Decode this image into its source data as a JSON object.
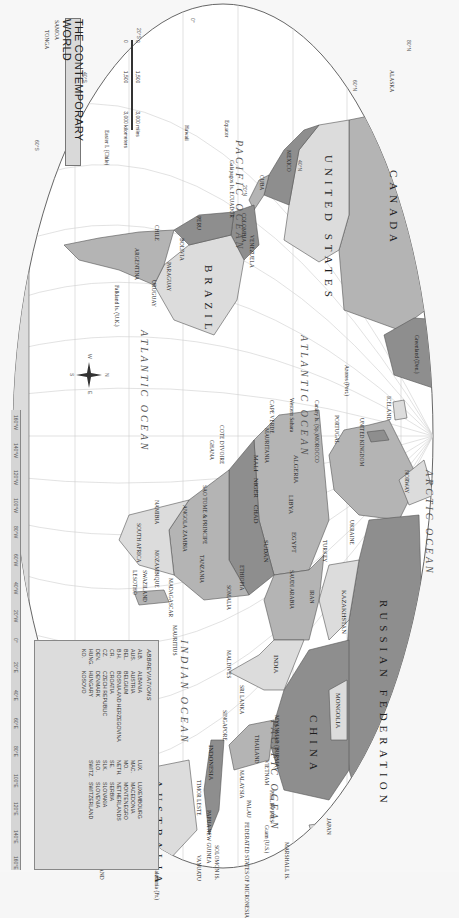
{
  "map": {
    "title": "THE CONTEMPORARY WORLD",
    "orientation": "rotated 90 degrees clockwise",
    "colors": {
      "background": "#f7f7f7",
      "ocean": "#ffffff",
      "land_light": "#dcdcdc",
      "land_mid": "#b4b4b4",
      "land_dark": "#8e8e8e",
      "graticule": "#c8c8c8",
      "border": "#555555"
    },
    "oceans": [
      {
        "id": "pacific-east",
        "label": "PACIFIC OCEAN"
      },
      {
        "id": "pacific-west",
        "label": "PACIFIC OCEAN"
      },
      {
        "id": "atlantic-north",
        "label": "ATLANTIC OCEAN"
      },
      {
        "id": "atlantic-south",
        "label": "ATLANTIC OCEAN"
      },
      {
        "id": "indian",
        "label": "INDIAN OCEAN"
      },
      {
        "id": "arctic",
        "label": "ARCTIC OCEAN"
      }
    ],
    "major_labels": {
      "russia": "RUSSIAN FEDERATION",
      "canada": "CANADA",
      "usa": "UNITED STATES",
      "china": "CHINA",
      "brazil": "BRAZIL",
      "australia": "AUSTRALIA",
      "antarctica": "ANTARCTICA",
      "kazakhstan": "KAZAKHSTAN",
      "mongolia": "MONGOLIA",
      "india": "INDIA",
      "alaska": "ALASKA",
      "greenland": "Greenland (Den.)",
      "iceland": "ICELAND",
      "mexico": "MEXICO",
      "argentina": "ARGENTINA",
      "chile": "CHILE",
      "peru": "PERU",
      "bolivia": "BOLIVIA",
      "paraguay": "PARAGUAY",
      "uruguay": "URUGUAY",
      "colombia": "COLOMBIA",
      "venezuela": "VENEZUELA",
      "algeria": "ALGERIA",
      "libya": "LIBYA",
      "egypt": "EGYPT",
      "sudan": "SUDAN",
      "chad": "CHAD",
      "niger": "NIGER",
      "mali": "MALI",
      "mauritania": "MAURITANIA",
      "ethiopia": "ETHIOPIA",
      "somalia": "SOMALIA",
      "angola": "ANGOLA",
      "namibia": "NAMIBIA",
      "south_africa": "SOUTH AFRICA",
      "mozambique": "MOZAMBIQUE",
      "madagascar": "MADAGASCAR",
      "tanzania": "TANZANIA",
      "zambia": "ZAMBIA",
      "iran": "IRAN",
      "saudi_arabia": "SAUDI ARABIA",
      "turkey": "TURKEY",
      "ukraine": "UKRAINE",
      "japan": "JAPAN",
      "philippines": "PHILIPPINES",
      "indonesia": "INDONESIA",
      "papua_new_guinea": "PAPUA NEW GUINEA",
      "new_zealand": "NEW ZEALAND",
      "united_kingdom": "UNITED KINGDOM",
      "ireland": "IRELAND",
      "portugal": "PORTUGAL",
      "spain": "SPAIN",
      "morocco": "MOROCCO",
      "norway": "NORWAY",
      "sweden": "SWEDEN",
      "finland": "FINLAND",
      "cuba": "CUBA",
      "myanmar": "MYANMAR (BURMA)",
      "thailand": "THAILAND",
      "vietnam": "VIETNAM",
      "malaysia": "MALAYSIA",
      "sri_lanka": "SRI LANKA",
      "maldives": "MALDIVES",
      "mauritius": "MAURITIUS",
      "singapore": "SINGAPORE",
      "timor_leste": "TIMOR LESTE",
      "tasmania": "Tasmania (AUST.)",
      "new_caledonia": "New Caledonia (Fr.)",
      "hawaii": "Hawaii",
      "samoa": "SAMOA",
      "tonga": "TONGA",
      "falkland": "Falkland Is. (U.K.)",
      "galapagos": "Galápagos Is. ECUADOR",
      "easter_island": "Easter I. (Chile)",
      "azores": "Azores (Port.)",
      "canary": "Canary Is. (Sp.)",
      "western_sahara": "Western Sahara",
      "cape_verde": "CAPE VERDE",
      "ghana": "GHANA",
      "cote_divoire": "COTE D'IVOIRE",
      "burkina_faso": "BURKINA FASO",
      "liberia": "LIBERIA",
      "sierra_leone": "SIERRA LEONE",
      "guinea": "GUINEA",
      "sao_tome": "SAO TOME & PRINCIPE",
      "swaziland": "SWAZILAND",
      "lesotho": "LESOTHO",
      "botswana": "BOTSWANA",
      "zimbabwe": "ZIMBABWE",
      "seychelles": "SEYCHELLES",
      "comoros": "COMOROS",
      "marshall": "MARSHALL IS.",
      "kiribati": "KIRIBATI",
      "tuvalu": "TUVALU",
      "solomon": "SOLOMON IS.",
      "vanuatu": "VANUATU",
      "fiji": "FIJI",
      "nauru": "NAURU",
      "palau": "PALAU",
      "micronesia": "FEDERATED STATES OF MICRONESIA",
      "guam": "Guam (U.S.)",
      "mariana": "Mariana Is. (U.S.)",
      "taiwan": "Taiwan",
      "north_korea": "N. KOREA",
      "south_korea": "S. KOREA",
      "brunei": "BRUNEI",
      "cambodia": "CAMBODIA",
      "laos": "LAOS",
      "bangladesh": "BANGLADESH",
      "bhutan": "BHUTAN",
      "nepal": "NEPAL",
      "pakistan": "PAKISTAN",
      "afghanistan": "AFGHANISTAN",
      "oman": "OMAN",
      "yemen": "YEMEN",
      "uae": "UNITED ARAB EMIRATES",
      "qatar": "QATAR",
      "kuwait": "KUWAIT",
      "iraq": "IRAQ",
      "syria": "SYRIA",
      "jordan": "JORDAN",
      "bahamas": "BAHAMAS",
      "haiti": "HAITI",
      "dominican": "DOMINICAN REPUBLIC",
      "jamaica": "JAMAICA",
      "guatemala": "GUATEMALA",
      "el_salvador": "EL SALVADOR",
      "honduras": "HONDURAS",
      "costa_rica": "COSTA RICA",
      "panama": "PANAMA",
      "guyana": "GUYANA",
      "suriname": "SURINAME",
      "french_guiana": "French Guiana (Fr.)",
      "ecuador": "ECUADOR",
      "trinidad": "TRINIDAD AND TOBAGO",
      "barbados": "BARBADOS",
      "grenada": "GRENADA",
      "dominica": "DOMINICA",
      "st_lucia": "ST. LUCIA",
      "st_kitts": "ST. KITTS AND NEVIS",
      "antigua": "ANTIGUA AND BARBUDA",
      "st_vincent": "ST. VINCENT & THE GRENADINES",
      "equator": "Equator"
    },
    "latitude_ticks": [
      "80°N",
      "60°N",
      "40°N",
      "20°N",
      "0°",
      "20°S",
      "40°S",
      "60°S"
    ],
    "longitude_ticks": [
      "160°W",
      "140°W",
      "120°W",
      "100°W",
      "80°W",
      "60°W",
      "40°W",
      "20°W",
      "0°",
      "20°E",
      "40°E",
      "60°E",
      "80°E",
      "100°E",
      "120°E",
      "140°E",
      "160°E"
    ],
    "scale": {
      "miles_labels": [
        "0",
        "1,500",
        "3,000 miles"
      ],
      "km_labels": [
        "0",
        "1,500",
        "3,000 kilometers"
      ]
    },
    "compass": {
      "n": "N",
      "s": "S",
      "e": "E",
      "w": "W"
    },
    "abbreviations": {
      "heading": "ABBREVIATIONS",
      "items": [
        {
          "abbr": "ALB.",
          "name": "ALBANIA"
        },
        {
          "abbr": "AUS.",
          "name": "AUSTRIA"
        },
        {
          "abbr": "BEL.",
          "name": "BELGIUM"
        },
        {
          "abbr": "B.H.",
          "name": "BOSNIA AND HERZEGOVINA"
        },
        {
          "abbr": "CR.",
          "name": "CROATIA"
        },
        {
          "abbr": "CZ.",
          "name": "CZECH REPUBLIC"
        },
        {
          "abbr": "DEN.",
          "name": "DENMARK"
        },
        {
          "abbr": "HUNG.",
          "name": "HUNGARY"
        },
        {
          "abbr": "KO.",
          "name": "KOSOVO"
        },
        {
          "abbr": "LUX.",
          "name": "LUXEMBOURG"
        },
        {
          "abbr": "MAC.",
          "name": "MACEDONIA"
        },
        {
          "abbr": "MO.",
          "name": "MONTENEGRO"
        },
        {
          "abbr": "NETH.",
          "name": "NETHERLANDS"
        },
        {
          "abbr": "SE.",
          "name": "SERBIA"
        },
        {
          "abbr": "SLK.",
          "name": "SLOVAKIA"
        },
        {
          "abbr": "SLO.",
          "name": "SLOVENIA"
        },
        {
          "abbr": "SWITZ.",
          "name": "SWITZERLAND"
        }
      ]
    }
  }
}
